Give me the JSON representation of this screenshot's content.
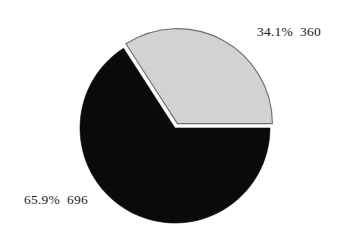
{
  "chart_data": {
    "type": "pie",
    "title": "",
    "subtitle": "",
    "xlabel": "",
    "ylabel": "",
    "grid": false,
    "legend": "none",
    "label_format": "percent + value",
    "total": 1056,
    "categories": [
      "360",
      "696"
    ],
    "values": [
      360,
      696
    ],
    "percentages": [
      34.1,
      65.9
    ],
    "slices": [
      {
        "label": "34.1%  360",
        "percent_text": "34.1%",
        "value_text": "360",
        "percent": 34.1,
        "value": 360,
        "color": "#d2d2d2",
        "edge_color": "#6e6e6e",
        "exploded": true,
        "start_angle_deg": 0,
        "sweep_deg": 122.8,
        "label_position": "upper-right"
      },
      {
        "label": "65.9%  696",
        "percent_text": "65.9%",
        "value_text": "696",
        "percent": 65.9,
        "value": 696,
        "color": "#0a0a0a",
        "edge_color": "#0a0a0a",
        "exploded": false,
        "start_angle_deg": 122.8,
        "sweep_deg": 237.2,
        "label_position": "lower-left"
      }
    ],
    "geometry": {
      "center_x": 175,
      "center_y": 128,
      "radius": 95,
      "explode_offset": 5,
      "start_angle_deg": 0,
      "direction": "counterclockwise"
    },
    "colors": {
      "background": "#ffffff",
      "text": "#1a1a1a",
      "slice_light": "#d2d2d2",
      "slice_dark": "#0a0a0a",
      "slice_outline": "#6e6e6e"
    }
  }
}
